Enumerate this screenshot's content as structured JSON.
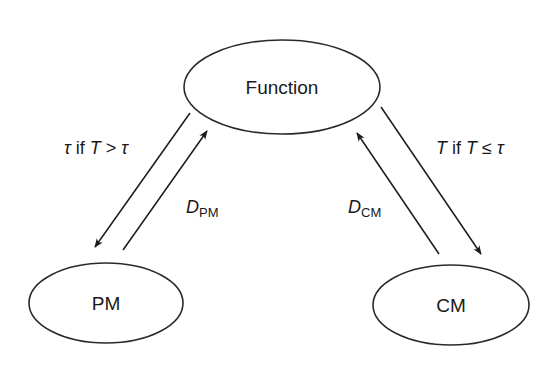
{
  "diagram": {
    "type": "state-transition",
    "colors": {
      "stroke": "#2a2a2a",
      "text": "#1a1a1a",
      "background": "#ffffff"
    },
    "nodes": [
      {
        "id": "function",
        "label": "Function"
      },
      {
        "id": "pm",
        "label": "PM"
      },
      {
        "id": "cm",
        "label": "CM"
      }
    ],
    "edges": [
      {
        "from": "function",
        "to": "pm",
        "label": {
          "part1": "τ",
          "part2": " if ",
          "part3": "T",
          "part4": " > ",
          "part5": "τ"
        }
      },
      {
        "from": "pm",
        "to": "function",
        "label": {
          "main": "D",
          "sub": "PM"
        }
      },
      {
        "from": "cm",
        "to": "function",
        "label": {
          "main": "D",
          "sub": "CM"
        }
      },
      {
        "from": "function",
        "to": "cm",
        "label": {
          "part1": "T",
          "part2": " if ",
          "part3": "T",
          "part4": " ≤ ",
          "part5": "τ"
        }
      }
    ]
  }
}
